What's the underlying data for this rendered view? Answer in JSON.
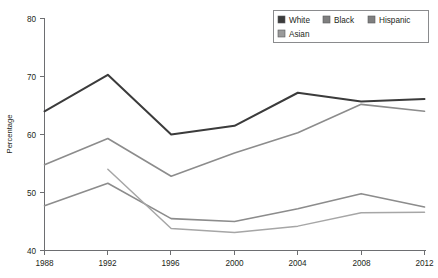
{
  "chart_data": {
    "type": "line",
    "title": "",
    "subtitle": "",
    "xlabel": "",
    "ylabel": "Percentage",
    "x": [
      1988,
      1992,
      1996,
      2000,
      2004,
      2008,
      2012
    ],
    "categories": [
      "1988",
      "1992",
      "1996",
      "2000",
      "2004",
      "2008",
      "2012"
    ],
    "xlim": [
      1988,
      2012
    ],
    "ylim": [
      40,
      80
    ],
    "y_ticks": [
      40,
      50,
      60,
      70,
      80
    ],
    "y_tick_labels": [
      "40",
      "50",
      "60",
      "70",
      "80"
    ],
    "x_ticks": [
      1988,
      1992,
      1996,
      2000,
      2004,
      2008,
      2012
    ],
    "x_tick_labels": [
      "1988",
      "1992",
      "1996",
      "2000",
      "2004",
      "2008",
      "2012"
    ],
    "grid": false,
    "legend_position": "top-right",
    "series": [
      {
        "name": "White",
        "color": "#3b3b3b",
        "x": [
          1988,
          1992,
          1996,
          2000,
          2004,
          2008,
          2012
        ],
        "values": [
          64.0,
          70.3,
          60.0,
          61.5,
          67.2,
          65.7,
          66.1
        ]
      },
      {
        "name": "Black",
        "color": "#8c8c8c",
        "x": [
          1988,
          1992,
          1996,
          2000,
          2004,
          2008,
          2012
        ],
        "values": [
          54.8,
          59.3,
          52.8,
          56.8,
          60.3,
          65.2,
          64.0
        ]
      },
      {
        "name": "Hispanic",
        "color": "#8c8c8c",
        "x": [
          1988,
          1992,
          1996,
          2000,
          2004,
          2008,
          2012
        ],
        "values": [
          47.7,
          51.6,
          45.5,
          45.0,
          47.2,
          49.8,
          47.5
        ]
      },
      {
        "name": "Asian",
        "color": "#a6a6a6",
        "x": [
          1992,
          1996,
          2000,
          2004,
          2008,
          2012
        ],
        "values": [
          54.0,
          43.8,
          43.1,
          44.2,
          46.5,
          46.6
        ]
      }
    ]
  },
  "legend": {
    "items": [
      {
        "label": "White",
        "color": "#3b3b3b"
      },
      {
        "label": "Black",
        "color": "#7f7f7f"
      },
      {
        "label": "Hispanic",
        "color": "#7f7f7f"
      },
      {
        "label": "Asian",
        "color": "#9a9a9a"
      }
    ]
  },
  "axes": {
    "y_title": "Percentage"
  }
}
